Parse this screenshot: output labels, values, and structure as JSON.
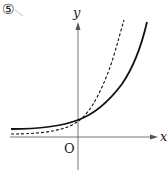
{
  "figure": {
    "number_label": "⑤",
    "x_axis_label": "x",
    "y_axis_label": "y",
    "origin_label": "O"
  },
  "curves": [
    {
      "name": "solid-exponential-curve",
      "style": "solid",
      "description": "slower growing exponential, horizontal asymptote slightly above x-axis"
    },
    {
      "name": "dashed-exponential-curve",
      "style": "dashed",
      "description": "faster growing exponential, horizontal asymptote just above x-axis"
    }
  ],
  "colors": {
    "curve": "#111111",
    "axis": "#666666",
    "background": "#ffffff"
  }
}
